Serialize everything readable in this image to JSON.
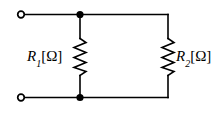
{
  "figure": {
    "name": "parallel-resistor-circuit",
    "type": "electrical-schematic",
    "background_color": "#ffffff",
    "line_color": "#000000"
  },
  "labels": {
    "r1": {
      "symbol": "R",
      "subscript": "1",
      "unit": "[Ω]"
    },
    "r2": {
      "symbol": "R",
      "subscript": "2",
      "unit": "[Ω]"
    }
  },
  "components": {
    "terminals": [
      {
        "name": "terminal-top-left",
        "cx": 21,
        "cy": 14.5,
        "r": 3.5
      },
      {
        "name": "terminal-bottom-left",
        "cx": 21,
        "cy": 97.5,
        "r": 3.5
      }
    ],
    "junctions": [
      {
        "name": "node-top",
        "cx": 80,
        "cy": 14.5,
        "r": 3.6
      },
      {
        "name": "node-bottom",
        "cx": 80,
        "cy": 97.5,
        "r": 3.6
      }
    ],
    "resistors": [
      {
        "name": "resistor-r1",
        "x": 80,
        "y_top": 38,
        "y_bottom": 76
      },
      {
        "name": "resistor-r2",
        "x": 168,
        "y_top": 38,
        "y_bottom": 76
      }
    ]
  }
}
